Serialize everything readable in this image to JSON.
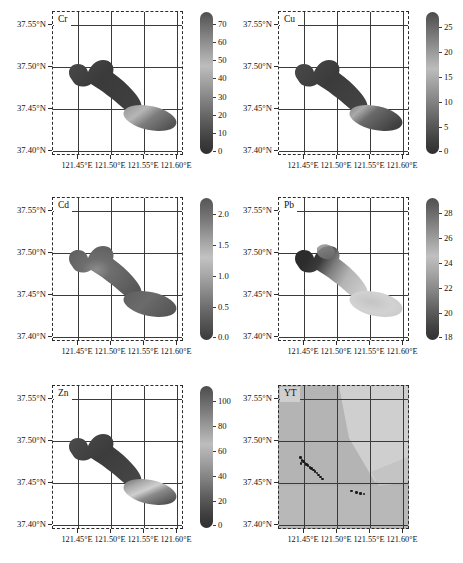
{
  "figure": {
    "kind": "multi-panel spatial interpolation maps",
    "panel_count": 6
  },
  "axes": {
    "y_ticks": [
      "37.55°N",
      "37.50°N",
      "37.45°N",
      "37.40°N"
    ],
    "y_values": [
      37.55,
      37.5,
      37.45,
      37.4
    ],
    "x_ticks": [
      "121.45°E",
      "121.50°E",
      "121.55°E",
      "121.60°E"
    ],
    "x_values": [
      121.45,
      121.5,
      121.55,
      121.6
    ],
    "xlim": [
      121.415,
      121.625
    ],
    "ylim": [
      37.395,
      37.567
    ]
  },
  "panels": [
    {
      "id": "cr",
      "label": "Cr",
      "colorbar": {
        "ticks": [
          "70",
          "60",
          "50",
          "40",
          "30",
          "20",
          "10",
          "0"
        ],
        "values": [
          70,
          60,
          50,
          40,
          30,
          20,
          10,
          0
        ],
        "min": 0,
        "max": 74,
        "ramp": "grayscale-light-to-dark"
      }
    },
    {
      "id": "cu",
      "label": "Cu",
      "colorbar": {
        "ticks": [
          "25",
          "20",
          "15",
          "10",
          "5",
          "0"
        ],
        "values": [
          25,
          20,
          15,
          10,
          5,
          0
        ],
        "min": 0,
        "max": 27,
        "ramp": "grayscale-light-to-dark"
      }
    },
    {
      "id": "cd",
      "label": "Cd",
      "colorbar": {
        "ticks": [
          "2.0",
          "1.5",
          "1.0",
          "0.5",
          "0.0"
        ],
        "values": [
          2.0,
          1.5,
          1.0,
          0.5,
          0.0
        ],
        "min": 0.0,
        "max": 2.15,
        "ramp": "grayscale-light-to-dark"
      }
    },
    {
      "id": "pb",
      "label": "Pb",
      "colorbar": {
        "ticks": [
          "28",
          "26",
          "24",
          "22",
          "20",
          "18"
        ],
        "values": [
          28,
          26,
          24,
          22,
          20,
          18
        ],
        "min": 18,
        "max": 29,
        "ramp": "grayscale-light-to-dark"
      }
    },
    {
      "id": "zn",
      "label": "Zn",
      "colorbar": {
        "ticks": [
          "100",
          "80",
          "60",
          "40",
          "20",
          "0"
        ],
        "values": [
          100,
          80,
          60,
          40,
          20,
          0
        ],
        "min": 0,
        "max": 107,
        "ramp": "grayscale-light-to-dark"
      }
    },
    {
      "id": "yt",
      "label": "YT",
      "colorbar": null,
      "basemap": "shaded gray terrain with lighter highland polygon",
      "sample_points_count": 19
    }
  ],
  "yt_sample_points": [
    {
      "lon": 121.4495,
      "lat": 37.4815
    },
    {
      "lon": 121.452,
      "lat": 37.4778
    },
    {
      "lon": 121.454,
      "lat": 37.4765
    },
    {
      "lon": 121.4505,
      "lat": 37.4745
    },
    {
      "lon": 121.4565,
      "lat": 37.4748
    },
    {
      "lon": 121.4592,
      "lat": 37.4733
    },
    {
      "lon": 121.4618,
      "lat": 37.4718
    },
    {
      "lon": 121.4645,
      "lat": 37.47
    },
    {
      "lon": 121.4672,
      "lat": 37.4685
    },
    {
      "lon": 121.47,
      "lat": 37.4668
    },
    {
      "lon": 121.4728,
      "lat": 37.465
    },
    {
      "lon": 121.4758,
      "lat": 37.463
    },
    {
      "lon": 121.4788,
      "lat": 37.4608
    },
    {
      "lon": 121.4818,
      "lat": 37.4585
    },
    {
      "lon": 121.4848,
      "lat": 37.4558
    },
    {
      "lon": 121.5315,
      "lat": 37.4418
    },
    {
      "lon": 121.5395,
      "lat": 37.44
    },
    {
      "lon": 121.5455,
      "lat": 37.4385
    },
    {
      "lon": 121.5515,
      "lat": 37.4382
    }
  ]
}
